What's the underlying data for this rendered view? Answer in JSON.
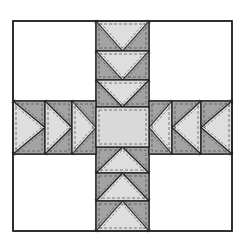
{
  "diagram": {
    "canvas": {
      "width": 245,
      "height": 248,
      "background": "#ffffff"
    },
    "colors": {
      "background_square": "#ffffff",
      "light_fabric": "#dedede",
      "dark_fabric": "#a3a3a3",
      "center_square": "#d9d9d9",
      "outline": "#1e1e1e",
      "stitch": "#4a4a4a"
    },
    "outer_block": {
      "x": 13,
      "y": 21,
      "w": 219,
      "h": 210
    },
    "center_column": {
      "x": 96,
      "w": 53
    },
    "horizontal_band": {
      "y": 101,
      "h": 53
    },
    "center_square": {
      "x": 96,
      "y": 107,
      "w": 53,
      "h": 40
    },
    "units": [
      {
        "id": "top-1",
        "dir": "down",
        "x": 96,
        "y": 21,
        "w": 53,
        "h": 30
      },
      {
        "id": "top-2",
        "dir": "down",
        "x": 96,
        "y": 51,
        "w": 53,
        "h": 29
      },
      {
        "id": "top-3",
        "dir": "down",
        "x": 96,
        "y": 80,
        "w": 53,
        "h": 27
      },
      {
        "id": "bottom-1",
        "dir": "up",
        "x": 96,
        "y": 147,
        "w": 53,
        "h": 26
      },
      {
        "id": "bottom-2",
        "dir": "up",
        "x": 96,
        "y": 173,
        "w": 53,
        "h": 28
      },
      {
        "id": "bottom-3",
        "dir": "up",
        "x": 96,
        "y": 201,
        "w": 53,
        "h": 30
      },
      {
        "id": "left-1",
        "dir": "right",
        "x": 13,
        "y": 101,
        "w": 32,
        "h": 53
      },
      {
        "id": "left-2",
        "dir": "right",
        "x": 45,
        "y": 101,
        "w": 27,
        "h": 53
      },
      {
        "id": "left-3",
        "dir": "right",
        "x": 72,
        "y": 101,
        "w": 24,
        "h": 53
      },
      {
        "id": "right-1",
        "dir": "left",
        "x": 149,
        "y": 101,
        "w": 23,
        "h": 53
      },
      {
        "id": "right-2",
        "dir": "left",
        "x": 172,
        "y": 101,
        "w": 29,
        "h": 53
      },
      {
        "id": "right-3",
        "dir": "left",
        "x": 201,
        "y": 101,
        "w": 31,
        "h": 53
      }
    ],
    "corner_squares": [
      {
        "id": "top-left",
        "x": 13,
        "y": 21,
        "w": 83,
        "h": 80
      },
      {
        "id": "top-right",
        "x": 149,
        "y": 21,
        "w": 83,
        "h": 80
      },
      {
        "id": "bottom-left",
        "x": 13,
        "y": 154,
        "w": 83,
        "h": 77
      },
      {
        "id": "bottom-right",
        "x": 149,
        "y": 154,
        "w": 83,
        "h": 77
      }
    ]
  }
}
